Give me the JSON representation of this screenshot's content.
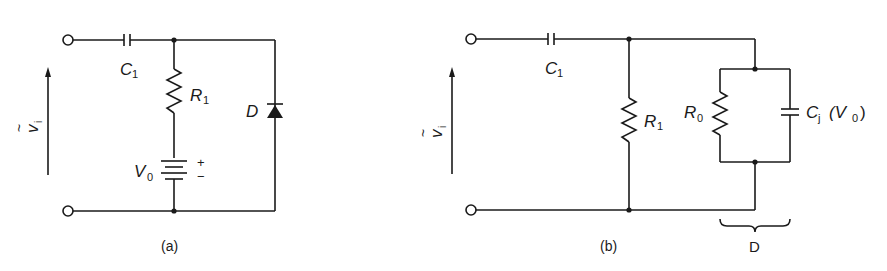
{
  "figure": {
    "panels": [
      {
        "id": "a",
        "caption": "(a)",
        "input_label": "v",
        "input_label_tilde": "~",
        "input_label_sub": "i",
        "capacitor": {
          "name": "C",
          "sub": "1"
        },
        "resistor": {
          "name": "R",
          "sub": "1"
        },
        "battery": {
          "name": "V",
          "sub": "0",
          "plus": "+",
          "minus": "−"
        },
        "diode": {
          "name": "D"
        }
      },
      {
        "id": "b",
        "caption": "(b)",
        "input_label": "v",
        "input_label_tilde": "~",
        "input_label_sub": "i",
        "capacitor": {
          "name": "C",
          "sub": "1"
        },
        "resistor": {
          "name": "R",
          "sub": "1"
        },
        "diode_resistor": {
          "name": "R",
          "sub": "0"
        },
        "junction_capacitor": {
          "name": "C",
          "sub": "j",
          "arg_open": "(V",
          "arg_sub": "0",
          "arg_close": ")"
        },
        "bracket_label": "D"
      }
    ]
  }
}
